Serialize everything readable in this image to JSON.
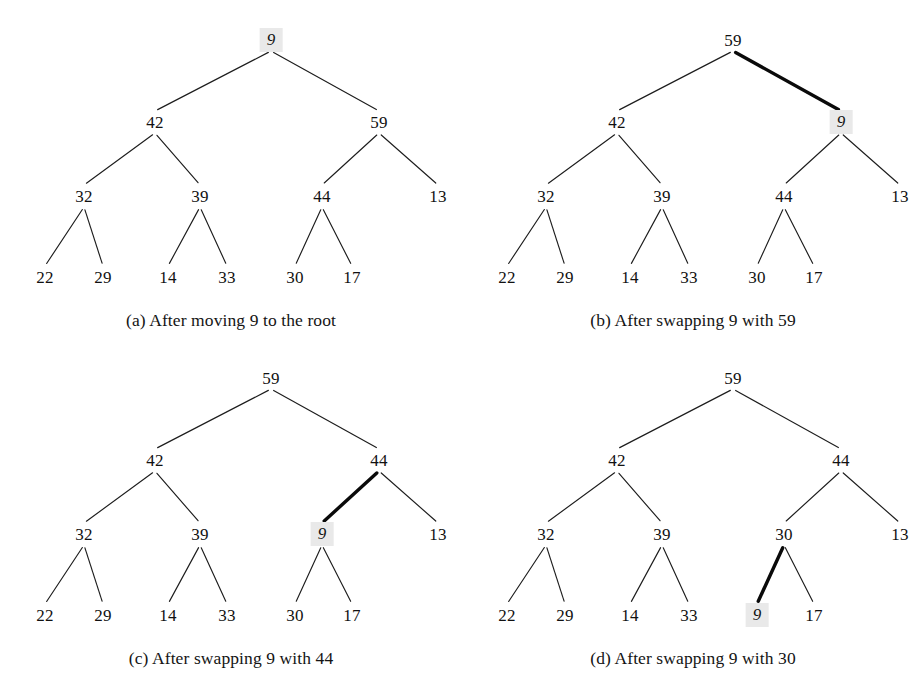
{
  "figure": {
    "background_color": "#ffffff",
    "ink_color": "#1a1a1a",
    "highlight_color": "#e9e9e9",
    "bold_edge_color": "#0a0a0a"
  },
  "panels": [
    {
      "id": "a",
      "caption": "(a) After moving 9 to the root",
      "nodes": [
        {
          "id": "root",
          "label": "9",
          "x": 271,
          "y": 40,
          "highlight": true
        },
        {
          "id": "l1a",
          "label": "42",
          "x": 155,
          "y": 122,
          "highlight": false
        },
        {
          "id": "l1b",
          "label": "59",
          "x": 379,
          "y": 122,
          "highlight": false
        },
        {
          "id": "l2a",
          "label": "32",
          "x": 84,
          "y": 196,
          "highlight": false
        },
        {
          "id": "l2b",
          "label": "39",
          "x": 200,
          "y": 196,
          "highlight": false
        },
        {
          "id": "l2c",
          "label": "44",
          "x": 322,
          "y": 196,
          "highlight": false
        },
        {
          "id": "l2d",
          "label": "13",
          "x": 438,
          "y": 196,
          "highlight": false
        },
        {
          "id": "l3a",
          "label": "22",
          "x": 45,
          "y": 277,
          "highlight": false
        },
        {
          "id": "l3b",
          "label": "29",
          "x": 103,
          "y": 277,
          "highlight": false
        },
        {
          "id": "l3c",
          "label": "14",
          "x": 168,
          "y": 277,
          "highlight": false
        },
        {
          "id": "l3d",
          "label": "33",
          "x": 227,
          "y": 277,
          "highlight": false
        },
        {
          "id": "l3e",
          "label": "30",
          "x": 295,
          "y": 277,
          "highlight": false
        },
        {
          "id": "l3f",
          "label": "17",
          "x": 352,
          "y": 277,
          "highlight": false
        }
      ],
      "edges": [
        {
          "from": "root",
          "to": "l1a",
          "bold": false
        },
        {
          "from": "root",
          "to": "l1b",
          "bold": false
        },
        {
          "from": "l1a",
          "to": "l2a",
          "bold": false
        },
        {
          "from": "l1a",
          "to": "l2b",
          "bold": false
        },
        {
          "from": "l1b",
          "to": "l2c",
          "bold": false
        },
        {
          "from": "l1b",
          "to": "l2d",
          "bold": false
        },
        {
          "from": "l2a",
          "to": "l3a",
          "bold": false
        },
        {
          "from": "l2a",
          "to": "l3b",
          "bold": false
        },
        {
          "from": "l2b",
          "to": "l3c",
          "bold": false
        },
        {
          "from": "l2b",
          "to": "l3d",
          "bold": false
        },
        {
          "from": "l2c",
          "to": "l3e",
          "bold": false
        },
        {
          "from": "l2c",
          "to": "l3f",
          "bold": false
        }
      ]
    },
    {
      "id": "b",
      "caption": "(b) After swapping 9 with 59",
      "nodes": [
        {
          "id": "root",
          "label": "59",
          "x": 271,
          "y": 40,
          "highlight": false
        },
        {
          "id": "l1a",
          "label": "42",
          "x": 155,
          "y": 122,
          "highlight": false
        },
        {
          "id": "l1b",
          "label": "9",
          "x": 379,
          "y": 122,
          "highlight": true
        },
        {
          "id": "l2a",
          "label": "32",
          "x": 84,
          "y": 196,
          "highlight": false
        },
        {
          "id": "l2b",
          "label": "39",
          "x": 200,
          "y": 196,
          "highlight": false
        },
        {
          "id": "l2c",
          "label": "44",
          "x": 322,
          "y": 196,
          "highlight": false
        },
        {
          "id": "l2d",
          "label": "13",
          "x": 438,
          "y": 196,
          "highlight": false
        },
        {
          "id": "l3a",
          "label": "22",
          "x": 45,
          "y": 277,
          "highlight": false
        },
        {
          "id": "l3b",
          "label": "29",
          "x": 103,
          "y": 277,
          "highlight": false
        },
        {
          "id": "l3c",
          "label": "14",
          "x": 168,
          "y": 277,
          "highlight": false
        },
        {
          "id": "l3d",
          "label": "33",
          "x": 227,
          "y": 277,
          "highlight": false
        },
        {
          "id": "l3e",
          "label": "30",
          "x": 295,
          "y": 277,
          "highlight": false
        },
        {
          "id": "l3f",
          "label": "17",
          "x": 352,
          "y": 277,
          "highlight": false
        }
      ],
      "edges": [
        {
          "from": "root",
          "to": "l1a",
          "bold": false
        },
        {
          "from": "root",
          "to": "l1b",
          "bold": true
        },
        {
          "from": "l1a",
          "to": "l2a",
          "bold": false
        },
        {
          "from": "l1a",
          "to": "l2b",
          "bold": false
        },
        {
          "from": "l1b",
          "to": "l2c",
          "bold": false
        },
        {
          "from": "l1b",
          "to": "l2d",
          "bold": false
        },
        {
          "from": "l2a",
          "to": "l3a",
          "bold": false
        },
        {
          "from": "l2a",
          "to": "l3b",
          "bold": false
        },
        {
          "from": "l2b",
          "to": "l3c",
          "bold": false
        },
        {
          "from": "l2b",
          "to": "l3d",
          "bold": false
        },
        {
          "from": "l2c",
          "to": "l3e",
          "bold": false
        },
        {
          "from": "l2c",
          "to": "l3f",
          "bold": false
        }
      ]
    },
    {
      "id": "c",
      "caption": "(c) After swapping 9 with 44",
      "nodes": [
        {
          "id": "root",
          "label": "59",
          "x": 271,
          "y": 40,
          "highlight": false
        },
        {
          "id": "l1a",
          "label": "42",
          "x": 155,
          "y": 122,
          "highlight": false
        },
        {
          "id": "l1b",
          "label": "44",
          "x": 379,
          "y": 122,
          "highlight": false
        },
        {
          "id": "l2a",
          "label": "32",
          "x": 84,
          "y": 196,
          "highlight": false
        },
        {
          "id": "l2b",
          "label": "39",
          "x": 200,
          "y": 196,
          "highlight": false
        },
        {
          "id": "l2c",
          "label": "9",
          "x": 322,
          "y": 196,
          "highlight": true
        },
        {
          "id": "l2d",
          "label": "13",
          "x": 438,
          "y": 196,
          "highlight": false
        },
        {
          "id": "l3a",
          "label": "22",
          "x": 45,
          "y": 277,
          "highlight": false
        },
        {
          "id": "l3b",
          "label": "29",
          "x": 103,
          "y": 277,
          "highlight": false
        },
        {
          "id": "l3c",
          "label": "14",
          "x": 168,
          "y": 277,
          "highlight": false
        },
        {
          "id": "l3d",
          "label": "33",
          "x": 227,
          "y": 277,
          "highlight": false
        },
        {
          "id": "l3e",
          "label": "30",
          "x": 295,
          "y": 277,
          "highlight": false
        },
        {
          "id": "l3f",
          "label": "17",
          "x": 352,
          "y": 277,
          "highlight": false
        }
      ],
      "edges": [
        {
          "from": "root",
          "to": "l1a",
          "bold": false
        },
        {
          "from": "root",
          "to": "l1b",
          "bold": false
        },
        {
          "from": "l1a",
          "to": "l2a",
          "bold": false
        },
        {
          "from": "l1a",
          "to": "l2b",
          "bold": false
        },
        {
          "from": "l1b",
          "to": "l2c",
          "bold": true
        },
        {
          "from": "l1b",
          "to": "l2d",
          "bold": false
        },
        {
          "from": "l2a",
          "to": "l3a",
          "bold": false
        },
        {
          "from": "l2a",
          "to": "l3b",
          "bold": false
        },
        {
          "from": "l2b",
          "to": "l3c",
          "bold": false
        },
        {
          "from": "l2b",
          "to": "l3d",
          "bold": false
        },
        {
          "from": "l2c",
          "to": "l3e",
          "bold": false
        },
        {
          "from": "l2c",
          "to": "l3f",
          "bold": false
        }
      ]
    },
    {
      "id": "d",
      "caption": "(d) After swapping 9 with 30",
      "nodes": [
        {
          "id": "root",
          "label": "59",
          "x": 271,
          "y": 40,
          "highlight": false
        },
        {
          "id": "l1a",
          "label": "42",
          "x": 155,
          "y": 122,
          "highlight": false
        },
        {
          "id": "l1b",
          "label": "44",
          "x": 379,
          "y": 122,
          "highlight": false
        },
        {
          "id": "l2a",
          "label": "32",
          "x": 84,
          "y": 196,
          "highlight": false
        },
        {
          "id": "l2b",
          "label": "39",
          "x": 200,
          "y": 196,
          "highlight": false
        },
        {
          "id": "l2c",
          "label": "30",
          "x": 322,
          "y": 196,
          "highlight": false
        },
        {
          "id": "l2d",
          "label": "13",
          "x": 438,
          "y": 196,
          "highlight": false
        },
        {
          "id": "l3a",
          "label": "22",
          "x": 45,
          "y": 277,
          "highlight": false
        },
        {
          "id": "l3b",
          "label": "29",
          "x": 103,
          "y": 277,
          "highlight": false
        },
        {
          "id": "l3c",
          "label": "14",
          "x": 168,
          "y": 277,
          "highlight": false
        },
        {
          "id": "l3d",
          "label": "33",
          "x": 227,
          "y": 277,
          "highlight": false
        },
        {
          "id": "l3e",
          "label": "9",
          "x": 295,
          "y": 277,
          "highlight": true
        },
        {
          "id": "l3f",
          "label": "17",
          "x": 352,
          "y": 277,
          "highlight": false
        }
      ],
      "edges": [
        {
          "from": "root",
          "to": "l1a",
          "bold": false
        },
        {
          "from": "root",
          "to": "l1b",
          "bold": false
        },
        {
          "from": "l1a",
          "to": "l2a",
          "bold": false
        },
        {
          "from": "l1a",
          "to": "l2b",
          "bold": false
        },
        {
          "from": "l1b",
          "to": "l2c",
          "bold": false
        },
        {
          "from": "l1b",
          "to": "l2d",
          "bold": false
        },
        {
          "from": "l2a",
          "to": "l3a",
          "bold": false
        },
        {
          "from": "l2a",
          "to": "l3b",
          "bold": false
        },
        {
          "from": "l2b",
          "to": "l3c",
          "bold": false
        },
        {
          "from": "l2b",
          "to": "l3d",
          "bold": false
        },
        {
          "from": "l2c",
          "to": "l3e",
          "bold": true
        },
        {
          "from": "l2c",
          "to": "l3f",
          "bold": false
        }
      ]
    }
  ],
  "panel_positions": [
    {
      "left": 0,
      "top": 0
    },
    {
      "left": 462,
      "top": 0
    },
    {
      "left": 0,
      "top": 338
    },
    {
      "left": 462,
      "top": 338
    }
  ],
  "caption_y": 310
}
